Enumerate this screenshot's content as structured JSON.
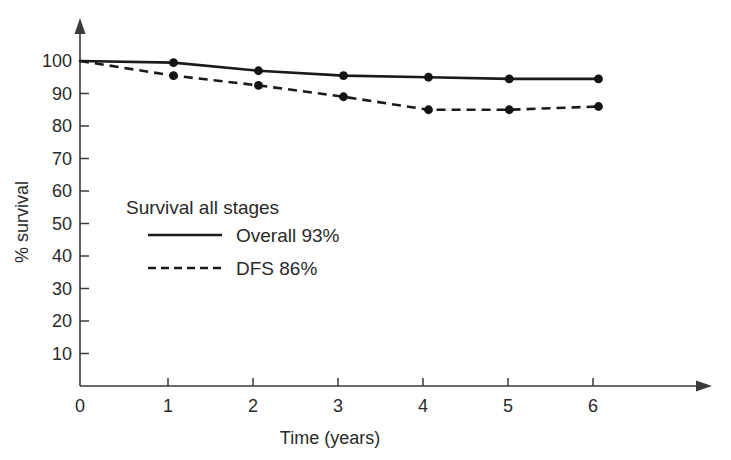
{
  "chart_data": {
    "type": "line",
    "title": "",
    "xlabel": "Time (years)",
    "ylabel": "% survival",
    "xlim": [
      0,
      6.6
    ],
    "ylim": [
      0,
      105
    ],
    "grid": false,
    "legend_position": "inner-left",
    "legend_title": "Survival all stages",
    "x_ticks": [
      0,
      1,
      2,
      3,
      4,
      5,
      6
    ],
    "x_tick_labels": [
      "0",
      "1",
      "2",
      "3",
      "4",
      "5",
      "6"
    ],
    "y_ticks": [
      0,
      10,
      20,
      30,
      40,
      50,
      60,
      70,
      80,
      90,
      100
    ],
    "y_tick_labels": [
      "0",
      "10",
      "20",
      "30",
      "40",
      "50",
      "60",
      "70",
      "80",
      "90",
      "100"
    ],
    "x": [
      0,
      1.1,
      2.1,
      3.1,
      4.1,
      5.05,
      6.1
    ],
    "series": [
      {
        "name": "Overall 93%",
        "style": "solid",
        "values": [
          100,
          99.5,
          97,
          95.5,
          95,
          94.5,
          94.5
        ]
      },
      {
        "name": "DFS 86%",
        "style": "dashed",
        "values": [
          100,
          95.5,
          92.5,
          89,
          85,
          85,
          86
        ]
      }
    ],
    "annotations": []
  },
  "axes": {
    "y_title": "% survival",
    "x_title": "Time (years)",
    "x_tick_labels": [
      "0",
      "1",
      "2",
      "3",
      "4",
      "5",
      "6"
    ],
    "y_tick_labels": [
      "10",
      "20",
      "30",
      "40",
      "50",
      "60",
      "70",
      "80",
      "90",
      "100"
    ],
    "origin_label": "0"
  },
  "legend": {
    "title": "Survival all stages",
    "entries": [
      {
        "label": "Overall 93%",
        "style": "solid"
      },
      {
        "label": "DFS 86%",
        "style": "dashed"
      }
    ]
  },
  "colors": {
    "ink": "#1a1a1a",
    "axis": "#3a3a3a",
    "background": "#ffffff"
  }
}
